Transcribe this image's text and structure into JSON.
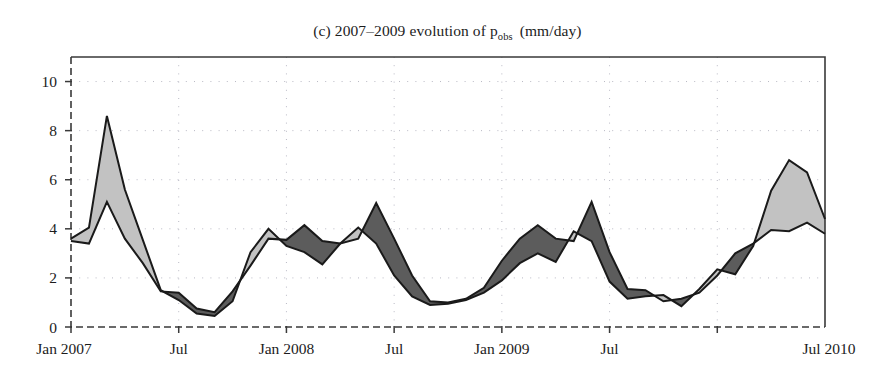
{
  "chart_data": {
    "type": "area",
    "title": "(c) 2007–2009 evolution of p",
    "title_subscript": "obs",
    "title_units": "(mm/day)",
    "title_full": "(c) 2007–2009 evolution of p_obs (mm/day)",
    "xlabel": "",
    "ylabel": "",
    "ylim": [
      0,
      11
    ],
    "xlim": [
      0,
      42
    ],
    "grid": true,
    "legend": false,
    "y_ticks": [
      0,
      2,
      4,
      6,
      8,
      10
    ],
    "y_tick_labels": [
      "0",
      "2",
      "4",
      "6",
      "8",
      "10"
    ],
    "x_ticks": [
      0,
      6,
      12,
      18,
      24,
      30,
      36
    ],
    "x_tick_labels": [
      "Jan 2007",
      "Jul",
      "Jan 2008",
      "Jul",
      "Jan 2009",
      "Jul",
      "Jul 2010"
    ],
    "x_tick_labels_shown": [
      "Jan 2007",
      "Jul",
      "Jan 2008",
      "Jul",
      "Jan 2009",
      "Jul",
      "Jul 2010"
    ],
    "colors": {
      "line": "#1a1a1a",
      "band_above": "#c2c2c2",
      "band_below": "#5c5c5c",
      "grid": "#b9b9c4",
      "axis": "#3a3a3a",
      "background": "#ffffff"
    },
    "band_above_label": "model above observation",
    "band_below_label": "model below observation",
    "x": [
      0,
      1,
      2,
      3,
      4,
      5,
      6,
      7,
      8,
      9,
      10,
      11,
      12,
      13,
      14,
      15,
      16,
      17,
      18,
      19,
      20,
      21,
      22,
      23,
      24,
      25,
      26,
      27,
      28,
      29,
      30,
      31,
      32,
      33,
      34,
      35,
      36
    ],
    "series": [
      {
        "name": "p_obs",
        "values": [
          3.5,
          3.4,
          5.1,
          3.6,
          2.6,
          1.45,
          1.4,
          0.75,
          0.6,
          1.45,
          2.5,
          3.6,
          3.55,
          4.15,
          3.5,
          3.4,
          3.6,
          5.05,
          3.6,
          2.1,
          1.05,
          1.0,
          1.15,
          1.6,
          2.7,
          3.6,
          4.15,
          3.6,
          3.5,
          5.1,
          3.05,
          1.55,
          1.5,
          1.05,
          1.15,
          1.4,
          2.1
        ]
      },
      {
        "name": "p_model",
        "values": [
          3.6,
          4.05,
          8.6,
          5.6,
          3.55,
          1.5,
          1.1,
          0.55,
          0.45,
          1.05,
          3.05,
          4.0,
          3.3,
          3.05,
          2.55,
          3.4,
          4.05,
          3.4,
          2.1,
          1.25,
          0.9,
          0.95,
          1.1,
          1.4,
          1.9,
          2.6,
          3.0,
          2.65,
          3.9,
          3.5,
          1.85,
          1.15,
          1.25,
          1.3,
          0.85,
          1.55,
          2.35
        ]
      }
    ],
    "series_tail": {
      "x": [
        37,
        38,
        39,
        40,
        41,
        42
      ],
      "obs": [
        3.0,
        3.4,
        3.95,
        3.9,
        4.25,
        3.8
      ],
      "model": [
        2.15,
        3.3,
        5.55,
        6.8,
        6.3,
        4.4
      ]
    }
  }
}
